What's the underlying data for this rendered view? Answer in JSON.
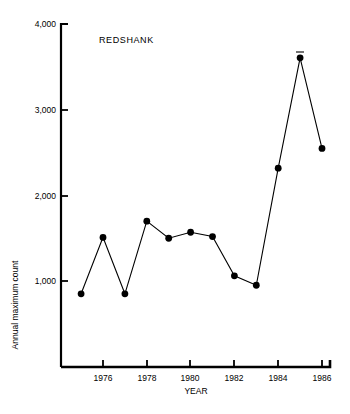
{
  "chart_data": {
    "type": "line",
    "title": "REDSHANK",
    "xlabel": "YEAR",
    "ylabel": "Annual maximum count",
    "x": [
      1975,
      1976,
      1977,
      1978,
      1979,
      1980,
      1981,
      1982,
      1983,
      1984,
      1985,
      1986
    ],
    "values": [
      850,
      1510,
      850,
      1700,
      1500,
      1570,
      1520,
      1060,
      950,
      2320,
      3610,
      2550
    ],
    "series": [
      {
        "name": "REDSHANK",
        "values": [
          850,
          1510,
          850,
          1700,
          1500,
          1570,
          1520,
          1060,
          950,
          2320,
          3610,
          2550
        ]
      }
    ],
    "xlim": [
      1974.5,
      1986.5
    ],
    "ylim": [
      0,
      4000
    ],
    "xticks": [
      1976,
      1978,
      1980,
      1982,
      1984,
      1986
    ],
    "xtick_labels": [
      "1976",
      "1978",
      "1980",
      "1982",
      "1984",
      "1986"
    ],
    "yticks": [
      1000,
      2000,
      3000,
      4000
    ],
    "ytick_labels": [
      "1,000",
      "2,000",
      "3,000",
      "4,000"
    ],
    "grid": false,
    "legend": false,
    "marker": "filled-circle",
    "line_color": "#000000",
    "marker_color": "#000000",
    "background_color": "#ffffff",
    "annotations": [
      {
        "name": "peak-cap-1985",
        "x": 1985,
        "y": 3750,
        "text": ""
      }
    ]
  },
  "axes": {
    "y_title": "Annual maximum count",
    "x_title": "YEAR"
  },
  "title": {
    "text": "REDSHANK"
  }
}
